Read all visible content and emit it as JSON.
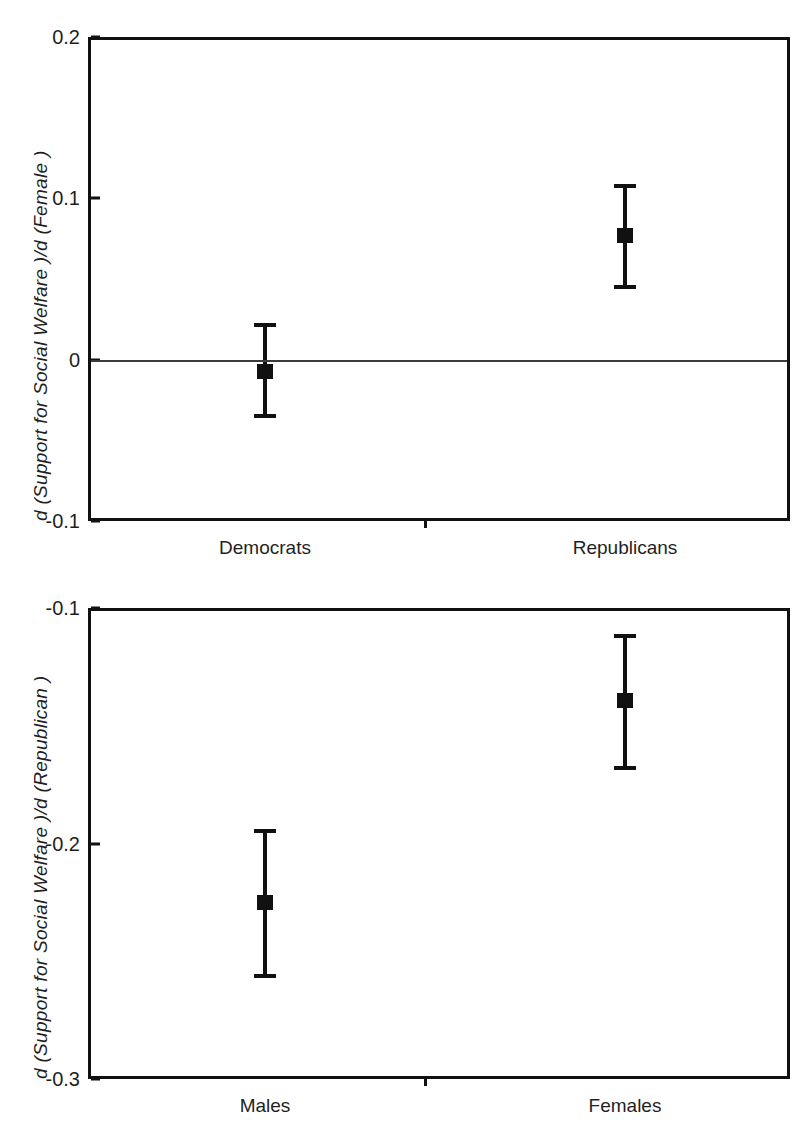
{
  "figure": {
    "cropped_top_caption": "",
    "marker_color": "#111111",
    "axis_color": "#111111",
    "reference_line_color": "#3b3b3b"
  },
  "chart_data": [
    {
      "id": "panel-top",
      "type": "scatter",
      "title": "",
      "xlabel": "",
      "ylabel": "d (Support for Social Welfare )/d (Female )",
      "ylabel_parts": {
        "prefix": "d (Support for Social Welfare )/d (",
        "variable": "Female",
        "suffix": " )"
      },
      "categories": [
        "Democrats",
        "Republicans"
      ],
      "ylim": [
        -0.1,
        0.2
      ],
      "yticks": [
        0.2,
        0.1,
        0,
        -0.1
      ],
      "ytick_labels": [
        "0.2",
        "0.1",
        "0",
        "-0.1"
      ],
      "grid": false,
      "legend": "none",
      "reference_line": 0,
      "values": [
        -0.007,
        0.077
      ],
      "ci_upper": [
        0.023,
        0.109
      ],
      "ci_lower": [
        -0.036,
        0.044
      ],
      "points": [
        {
          "category": "Democrats",
          "estimate": -0.007,
          "upper": 0.023,
          "lower": -0.036
        },
        {
          "category": "Republicans",
          "estimate": 0.077,
          "upper": 0.109,
          "lower": 0.044
        }
      ]
    },
    {
      "id": "panel-bottom",
      "type": "scatter",
      "title": "",
      "xlabel": "",
      "ylabel": "d (Support for Social Welfare )/d (Republican )",
      "ylabel_parts": {
        "prefix": "d (Support for Social Welfare )/d (",
        "variable": "Republican",
        "suffix": " )"
      },
      "categories": [
        "Males",
        "Females"
      ],
      "ylim": [
        -0.3,
        -0.1
      ],
      "yticks": [
        -0.1,
        -0.2,
        -0.3
      ],
      "ytick_labels": [
        "-0.1",
        "-0.2",
        "-0.3"
      ],
      "grid": false,
      "legend": "none",
      "reference_line": null,
      "values": [
        -0.225,
        -0.139
      ],
      "ci_upper": [
        -0.194,
        -0.111
      ],
      "ci_lower": [
        -0.257,
        -0.169
      ],
      "points": [
        {
          "category": "Males",
          "estimate": -0.225,
          "upper": -0.194,
          "lower": -0.257
        },
        {
          "category": "Females",
          "estimate": -0.139,
          "upper": -0.111,
          "lower": -0.169
        }
      ]
    }
  ]
}
